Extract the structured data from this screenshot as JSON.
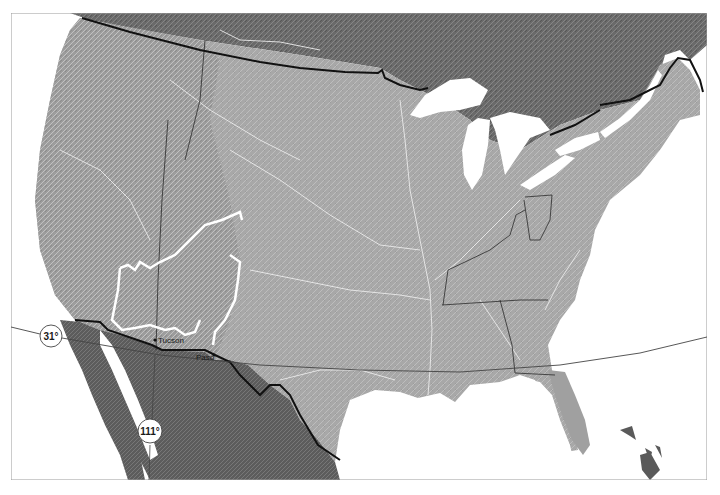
{
  "map": {
    "title": "",
    "frame": {
      "x": 11,
      "y": 13,
      "width": 696,
      "height": 467,
      "color": "#9a9a9a"
    },
    "colors": {
      "water": "#ffffff",
      "land_us": "#a9a9a9",
      "land_canada": "#6f6f6f",
      "land_mexico": "#5e5e5e",
      "rivers": "#e6e6e6",
      "international_border": "#111111",
      "state_border": "#2a2a2a",
      "region_outline": "#ffffff",
      "graticule": "#444444"
    },
    "graticule": {
      "latitude": {
        "label": "31°",
        "value": 31
      },
      "meridian": {
        "label": "111°",
        "value": 111
      }
    },
    "places": [
      {
        "name": "Tucson",
        "label": "Tucson"
      },
      {
        "name": "El Paso",
        "label": "Paso"
      }
    ],
    "regions": [
      {
        "name": "Great Lakes",
        "type": "water"
      },
      {
        "name": "Gulf of Mexico",
        "type": "water"
      },
      {
        "name": "Gulf of California",
        "type": "water"
      },
      {
        "name": "Pacific Ocean",
        "type": "water"
      },
      {
        "name": "Atlantic Ocean",
        "type": "water"
      },
      {
        "name": "Colorado Plateau outline",
        "type": "highlight-outline"
      }
    ]
  }
}
